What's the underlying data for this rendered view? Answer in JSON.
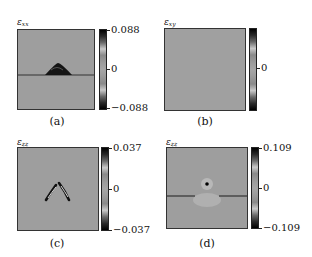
{
  "figure": {
    "panels": [
      {
        "id": "a",
        "caption": "(a)",
        "quantity_symbol": "ε",
        "quantity_subscript": "xx",
        "colorbar": {
          "max_label": "0.088",
          "mid_label": "0",
          "min_label": "−0.088",
          "max": 0.088,
          "min": -0.088
        },
        "feature": "dark semicircular cap above a horizontal crack line"
      },
      {
        "id": "b",
        "caption": "(b)",
        "quantity_symbol": "ε",
        "quantity_subscript": "xy",
        "colorbar": {
          "mid_label": "0"
        },
        "feature": "uniform field"
      },
      {
        "id": "c",
        "caption": "(c)",
        "quantity_symbol": "ε",
        "quantity_subscript": "zz",
        "colorbar": {
          "max_label": "0.037",
          "mid_label": "0",
          "min_label": "−0.037",
          "max": 0.037,
          "min": -0.037
        },
        "feature": "two curved dark arcs forming an inverted V"
      },
      {
        "id": "d",
        "caption": "(d)",
        "quantity_symbol": "ε",
        "quantity_subscript": "zz",
        "colorbar": {
          "max_label": "0.109",
          "mid_label": "0",
          "min_label": "−0.109",
          "max": 0.109,
          "min": -0.109
        },
        "feature": "point defect with halo above a broken horizontal line"
      }
    ]
  }
}
